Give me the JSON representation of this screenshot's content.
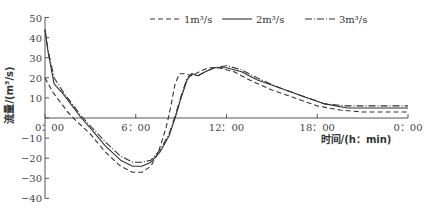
{
  "chart_data": {
    "type": "line",
    "title": "",
    "xlabel": "时间/(h：min)",
    "ylabel": "流量/(m³/s)",
    "ylim": [
      -40,
      50
    ],
    "xlim": [
      0,
      24
    ],
    "grid": false,
    "legend_position": "top",
    "y_ticks": [
      50,
      40,
      30,
      20,
      10,
      0,
      -10,
      -20,
      -30,
      -40
    ],
    "y_tick_labels": [
      "50",
      "40",
      "30",
      "20",
      "10",
      "0",
      "−10",
      "−20",
      "−30",
      "−40"
    ],
    "x_ticks": [
      0,
      6,
      12,
      18,
      24
    ],
    "x_tick_labels": [
      "0：00",
      "6：00",
      "12：00",
      "18：00",
      "0：00"
    ],
    "x_unit": "hours",
    "series": [
      {
        "name": "1m³/s",
        "style": "dashed",
        "points": [
          [
            0,
            20
          ],
          [
            0.5,
            13
          ],
          [
            1,
            8
          ],
          [
            1.5,
            3
          ],
          [
            2,
            -1
          ],
          [
            3,
            -8
          ],
          [
            4,
            -17
          ],
          [
            5,
            -24
          ],
          [
            5.8,
            -27
          ],
          [
            6.4,
            -27
          ],
          [
            7,
            -24
          ],
          [
            7.5,
            -17
          ],
          [
            8,
            -5
          ],
          [
            8.3,
            5
          ],
          [
            8.6,
            17
          ],
          [
            8.9,
            22
          ],
          [
            9.3,
            22
          ],
          [
            9.7,
            21
          ],
          [
            10.2,
            23
          ],
          [
            10.8,
            25
          ],
          [
            11.5,
            25
          ],
          [
            12.5,
            23
          ],
          [
            13.5,
            19
          ],
          [
            15,
            14
          ],
          [
            16.5,
            10
          ],
          [
            18,
            6
          ],
          [
            19.5,
            4
          ],
          [
            21,
            3
          ],
          [
            24,
            3
          ]
        ]
      },
      {
        "name": "2m³/s",
        "style": "solid",
        "points": [
          [
            0,
            44
          ],
          [
            0.2,
            33
          ],
          [
            0.6,
            17
          ],
          [
            1.2,
            12
          ],
          [
            1.8,
            6
          ],
          [
            2.4,
            0
          ],
          [
            3,
            -5
          ],
          [
            4,
            -14
          ],
          [
            5,
            -21
          ],
          [
            5.8,
            -24
          ],
          [
            6.4,
            -24
          ],
          [
            7,
            -22
          ],
          [
            7.6,
            -17
          ],
          [
            8.2,
            -9
          ],
          [
            8.6,
            0
          ],
          [
            9,
            10
          ],
          [
            9.4,
            19
          ],
          [
            9.7,
            22
          ],
          [
            10.1,
            21
          ],
          [
            10.6,
            23
          ],
          [
            11.2,
            25
          ],
          [
            12,
            25
          ],
          [
            13,
            23
          ],
          [
            14,
            19
          ],
          [
            15.5,
            15
          ],
          [
            17,
            11
          ],
          [
            18.5,
            7
          ],
          [
            20,
            5
          ],
          [
            21.5,
            5
          ],
          [
            24,
            5
          ]
        ]
      },
      {
        "name": "3m³/s",
        "style": "dash-dot",
        "points": [
          [
            0,
            44
          ],
          [
            0.2,
            34
          ],
          [
            0.6,
            20
          ],
          [
            1.2,
            13
          ],
          [
            1.8,
            7
          ],
          [
            2.4,
            1
          ],
          [
            3,
            -4
          ],
          [
            4,
            -12
          ],
          [
            5,
            -19
          ],
          [
            5.8,
            -22
          ],
          [
            6.4,
            -22
          ],
          [
            7,
            -21
          ],
          [
            7.6,
            -16
          ],
          [
            8.2,
            -8
          ],
          [
            8.6,
            1
          ],
          [
            9,
            11
          ],
          [
            9.4,
            20
          ],
          [
            9.7,
            22
          ],
          [
            10.1,
            21
          ],
          [
            10.6,
            23
          ],
          [
            11.2,
            25
          ],
          [
            12,
            26
          ],
          [
            13,
            24
          ],
          [
            14,
            20
          ],
          [
            15.5,
            15
          ],
          [
            17,
            11
          ],
          [
            18.5,
            7
          ],
          [
            20,
            6
          ],
          [
            21.5,
            6
          ],
          [
            24,
            6
          ]
        ]
      }
    ]
  },
  "legend": {
    "items": [
      {
        "label": "1m³/s",
        "style": "dashed"
      },
      {
        "label": "2m³/s",
        "style": "solid"
      },
      {
        "label": "3m³/s",
        "style": "dash-dot"
      }
    ]
  },
  "axes": {
    "ylabel": "流量/(m³/s)",
    "xlabel": "时间/(h：min)"
  },
  "colors": {
    "line": "#333333",
    "axis": "#555555"
  }
}
